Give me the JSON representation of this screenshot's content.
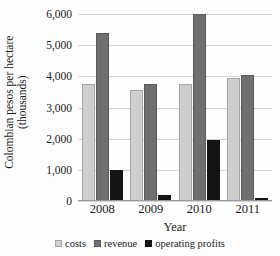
{
  "chart_data": {
    "type": "bar",
    "title": "",
    "xlabel": "Year",
    "ylabel": "Colombian pesos per hectare (thousands)",
    "ylabel_line1": "Colombian pesos per hectare",
    "ylabel_line2": "(thousands)",
    "categories": [
      "2008",
      "2009",
      "2010",
      "2011"
    ],
    "series": [
      {
        "name": "costs",
        "color": "#cfcfcf",
        "values": [
          3750,
          3550,
          3750,
          3950
        ]
      },
      {
        "name": "revenue",
        "color": "#6f6f6f",
        "values": [
          5400,
          3750,
          6000,
          4050
        ]
      },
      {
        "name": "operating profits",
        "color": "#141414",
        "values": [
          1000,
          200,
          1950,
          100
        ]
      }
    ],
    "ylim": [
      0,
      6000
    ],
    "y_ticks": [
      0,
      1000,
      2000,
      3000,
      4000,
      5000,
      6000
    ],
    "y_tick_labels": [
      "0",
      "1,000",
      "2,000",
      "3,000",
      "4,000",
      "5,000",
      "6,000"
    ],
    "grid": true,
    "legend_position": "bottom"
  }
}
